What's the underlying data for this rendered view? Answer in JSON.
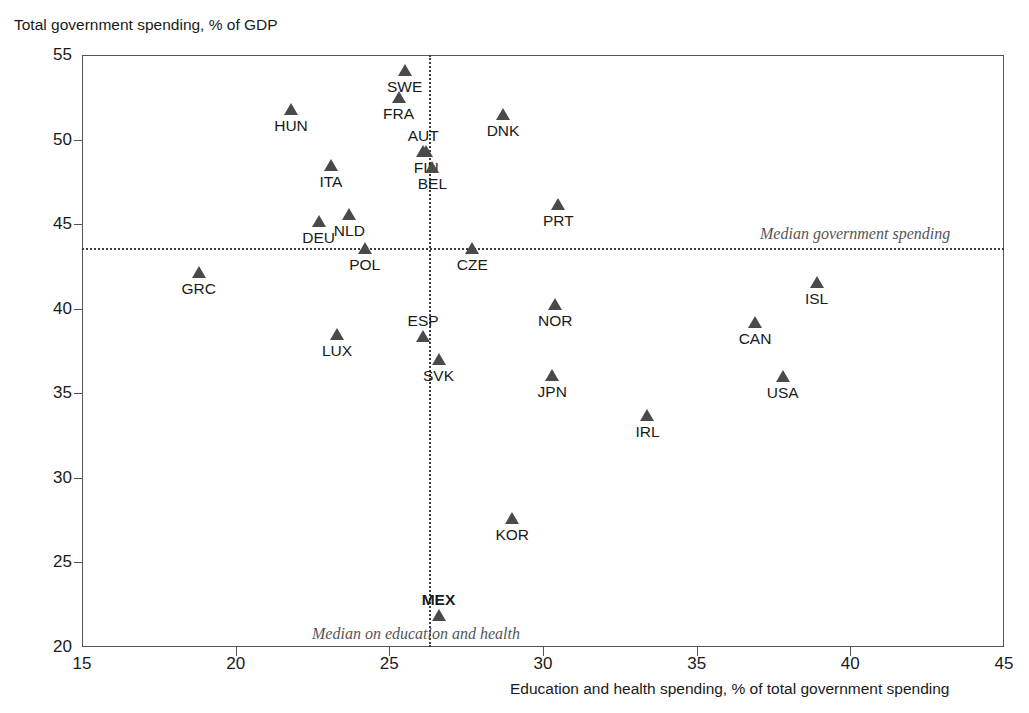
{
  "chart_data": {
    "type": "scatter",
    "title": "",
    "ylabel": "Total government spending, % of GDP",
    "xlabel": "Education and health spending, % of total government spending",
    "xlim": [
      15,
      45
    ],
    "ylim": [
      20,
      55
    ],
    "xticks": [
      "15",
      "20",
      "25",
      "30",
      "35",
      "40",
      "45"
    ],
    "yticks": [
      "20",
      "25",
      "30",
      "35",
      "40",
      "45",
      "50",
      "55"
    ],
    "grid": false,
    "legend": "none",
    "reference_lines": [
      {
        "orientation": "horizontal",
        "value": 43.6,
        "label": "Median government spending"
      },
      {
        "orientation": "vertical",
        "value": 26.3,
        "label": "Median on education and health"
      }
    ],
    "points": [
      {
        "label": "SWE",
        "x": 25.5,
        "y": 54.1,
        "label_pos": "below",
        "bold": false
      },
      {
        "label": "FRA",
        "x": 25.3,
        "y": 52.5,
        "label_pos": "below",
        "bold": false
      },
      {
        "label": "HUN",
        "x": 21.8,
        "y": 51.8,
        "label_pos": "below",
        "bold": false
      },
      {
        "label": "DNK",
        "x": 28.7,
        "y": 51.5,
        "label_pos": "below",
        "bold": false
      },
      {
        "label": "AUT",
        "x": 26.1,
        "y": 49.3,
        "label_pos": "above",
        "bold": false
      },
      {
        "label": "FIN",
        "x": 26.2,
        "y": 49.3,
        "label_pos": "below",
        "bold": false
      },
      {
        "label": "ITA",
        "x": 23.1,
        "y": 48.5,
        "label_pos": "below",
        "bold": false
      },
      {
        "label": "BEL",
        "x": 26.4,
        "y": 48.4,
        "label_pos": "below",
        "bold": false
      },
      {
        "label": "PRT",
        "x": 30.5,
        "y": 46.2,
        "label_pos": "below",
        "bold": false
      },
      {
        "label": "NLD",
        "x": 23.7,
        "y": 45.6,
        "label_pos": "below",
        "bold": false
      },
      {
        "label": "DEU",
        "x": 22.7,
        "y": 45.2,
        "label_pos": "below",
        "bold": false
      },
      {
        "label": "POL",
        "x": 24.2,
        "y": 43.6,
        "label_pos": "below",
        "bold": false
      },
      {
        "label": "CZE",
        "x": 27.7,
        "y": 43.6,
        "label_pos": "below",
        "bold": false
      },
      {
        "label": "GRC",
        "x": 18.8,
        "y": 42.2,
        "label_pos": "below",
        "bold": false
      },
      {
        "label": "ISL",
        "x": 38.9,
        "y": 41.6,
        "label_pos": "below",
        "bold": false
      },
      {
        "label": "NOR",
        "x": 30.4,
        "y": 40.3,
        "label_pos": "below",
        "bold": false
      },
      {
        "label": "CAN",
        "x": 36.9,
        "y": 39.2,
        "label_pos": "below",
        "bold": false
      },
      {
        "label": "LUX",
        "x": 23.3,
        "y": 38.5,
        "label_pos": "below",
        "bold": false
      },
      {
        "label": "ESP",
        "x": 26.1,
        "y": 38.4,
        "label_pos": "above",
        "bold": false
      },
      {
        "label": "SVK",
        "x": 26.6,
        "y": 37.0,
        "label_pos": "below",
        "bold": false
      },
      {
        "label": "JPN",
        "x": 30.3,
        "y": 36.1,
        "label_pos": "below",
        "bold": false
      },
      {
        "label": "USA",
        "x": 37.8,
        "y": 36.0,
        "label_pos": "below",
        "bold": false
      },
      {
        "label": "IRL",
        "x": 33.4,
        "y": 33.7,
        "label_pos": "below",
        "bold": false
      },
      {
        "label": "KOR",
        "x": 29.0,
        "y": 27.6,
        "label_pos": "below",
        "bold": false
      },
      {
        "label": "MEX",
        "x": 26.6,
        "y": 21.9,
        "label_pos": "above",
        "bold": true
      }
    ],
    "colors": {
      "marker": "#4a4a4a",
      "axis": "#555555",
      "text": "#1a1a1a",
      "annotation": "#555555"
    }
  }
}
